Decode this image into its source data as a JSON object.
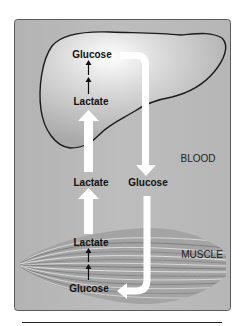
{
  "diagram": {
    "regions": {
      "blood": "BLOOD",
      "muscle": "MUSCLE"
    },
    "liver": {
      "top_label": "Glucose",
      "bottom_label": "Lactate"
    },
    "blood": {
      "left_label": "Lactate",
      "right_label": "Glucose"
    },
    "muscle": {
      "top_label": "Lactate",
      "bottom_label": "Glucose"
    },
    "colors": {
      "panel_bg": "#b9b9b9",
      "panel_border": "#555555",
      "liver_fill": "#c4c4c4",
      "liver_outline": "#1a1a1a",
      "arrow_white": "#ffffff",
      "text": "#111111"
    }
  }
}
